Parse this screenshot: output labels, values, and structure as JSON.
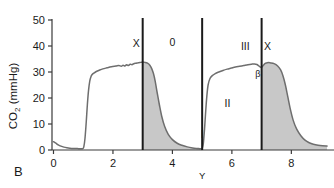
{
  "panel": {
    "label": "B"
  },
  "chart_data": {
    "type": "line",
    "title": "",
    "subtitle": "",
    "xlabel": "",
    "ylabel": "CO2 (mmHg)",
    "ylabel_main": "CO",
    "ylabel_sub": "2",
    "ylabel_unit": " (mmHg)",
    "grid": false,
    "legend": "none",
    "xlim": [
      -0.05,
      9.3
    ],
    "ylim": [
      0,
      50
    ],
    "xticks": [
      0,
      2,
      4,
      6,
      8
    ],
    "xtick_labels": [
      "0",
      "2",
      "4",
      "6",
      "8"
    ],
    "yticks": [
      0,
      10,
      20,
      30,
      40,
      50
    ],
    "ytick_labels": [
      "0",
      "10",
      "20",
      "30",
      "40",
      "50"
    ],
    "line_color": "#6e6e6e",
    "fill_color": "#c8c8c8",
    "marker_line_color": "#1a1a1a",
    "series": [
      {
        "name": "capnogram",
        "x": [
          0.0,
          0.08,
          0.16,
          0.25,
          0.35,
          0.45,
          0.55,
          0.68,
          0.8,
          0.9,
          0.98,
          1.02,
          1.06,
          1.1,
          1.14,
          1.18,
          1.22,
          1.26,
          1.3,
          1.36,
          1.44,
          1.54,
          1.66,
          1.8,
          1.95,
          2.1,
          2.2,
          2.28,
          2.34,
          2.4,
          2.46,
          2.52,
          2.58,
          2.64,
          2.7,
          2.78,
          2.86,
          2.94,
          3.0,
          3.08,
          3.16,
          3.24,
          3.3,
          3.36,
          3.42,
          3.48,
          3.56,
          3.64,
          3.74,
          3.86,
          4.0,
          4.16,
          4.32,
          4.5,
          4.68,
          4.82,
          4.92,
          4.98,
          5.0,
          5.04,
          5.08,
          5.12,
          5.16,
          5.2,
          5.26,
          5.34,
          5.44,
          5.56,
          5.7,
          5.84,
          5.98,
          6.12,
          6.26,
          6.4,
          6.54,
          6.66,
          6.76,
          6.84,
          6.9,
          6.95,
          7.0,
          7.06,
          7.12,
          7.2,
          7.3,
          7.42,
          7.54,
          7.64,
          7.72,
          7.8,
          7.88,
          7.96,
          8.06,
          8.18,
          8.32,
          8.46,
          8.6,
          8.74,
          8.9,
          9.05,
          9.2
        ],
        "y": [
          3.2,
          2.6,
          2.0,
          1.5,
          1.1,
          0.85,
          0.7,
          0.6,
          0.55,
          0.5,
          0.5,
          1.2,
          4.5,
          10.5,
          17.5,
          23.0,
          26.5,
          28.2,
          29.0,
          29.6,
          30.2,
          30.7,
          31.2,
          31.6,
          32.0,
          32.3,
          32.5,
          32.2,
          32.6,
          32.3,
          32.8,
          32.5,
          33.0,
          32.8,
          33.2,
          33.4,
          33.6,
          33.7,
          33.8,
          33.7,
          33.4,
          32.6,
          31.4,
          29.5,
          26.5,
          22.5,
          17.5,
          13.0,
          9.0,
          6.0,
          4.0,
          2.6,
          1.8,
          1.2,
          0.8,
          0.6,
          0.5,
          0.4,
          0.4,
          2.5,
          8.0,
          15.0,
          21.0,
          25.0,
          27.4,
          28.6,
          29.4,
          30.0,
          30.6,
          31.1,
          31.5,
          31.9,
          32.2,
          32.5,
          32.8,
          33.0,
          33.1,
          32.9,
          32.4,
          32.0,
          31.8,
          32.6,
          33.3,
          33.6,
          33.5,
          33.2,
          32.3,
          30.8,
          28.5,
          25.0,
          20.5,
          16.0,
          11.5,
          8.0,
          5.5,
          3.8,
          2.8,
          2.2,
          1.8,
          1.6,
          1.5
        ]
      }
    ],
    "fill_regions": [
      {
        "name": "expiratory-downstroke-fill-1",
        "x_start": 3.0,
        "x_end": 4.95
      },
      {
        "name": "expiratory-downstroke-fill-2",
        "x_start": 7.0,
        "x_end": 9.2
      }
    ],
    "vertical_markers": [
      {
        "name": "marker-x-1",
        "x": 3.0,
        "label": "X"
      },
      {
        "name": "marker-y",
        "x": 5.0,
        "label": "Y"
      },
      {
        "name": "marker-x-2",
        "x": 7.0,
        "label": "X"
      }
    ],
    "annotations": [
      {
        "name": "phase-0-label",
        "text": "0",
        "x": 4.0,
        "y": 40.0
      },
      {
        "name": "phase-I-label",
        "text": "I",
        "x": 5.0,
        "y": 4.5
      },
      {
        "name": "phase-II-label",
        "text": "II",
        "x": 5.85,
        "y": 16.5
      },
      {
        "name": "phase-III-label",
        "text": "III",
        "x": 6.45,
        "y": 38.5
      },
      {
        "name": "beta-angle-label",
        "text": "β",
        "x": 6.87,
        "y": 28.0
      },
      {
        "name": "x-marker-label-1",
        "text": "X",
        "x": 2.78,
        "y": 39.5
      },
      {
        "name": "x-marker-label-2",
        "text": "X",
        "x": 7.2,
        "y": 38.5
      }
    ],
    "x_axis_marker_label": "Y"
  }
}
